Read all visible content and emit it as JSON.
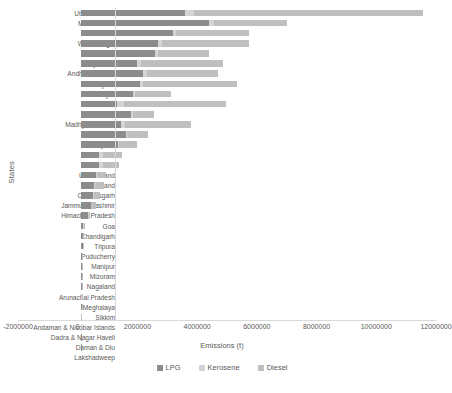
{
  "chart_data": {
    "type": "bar",
    "subtype": "horizontal-stacked",
    "title": "",
    "xlabel": "Emissions (t)",
    "ylabel": "States",
    "xlim": [
      -2000000,
      12000000
    ],
    "xticks": [
      -2000000,
      0,
      2000000,
      4000000,
      6000000,
      8000000,
      10000000,
      12000000
    ],
    "xtick_labels": [
      "-2000000",
      "0",
      "2000000",
      "4000000",
      "6000000",
      "8000000",
      "10000000",
      "12000000"
    ],
    "grid": false,
    "legend_position": "bottom",
    "legend": [
      "LPG",
      "Kerosene",
      "Diesel"
    ],
    "colors": {
      "LPG": "#8c8c8c",
      "Kerosene": "#d4d4d4",
      "Diesel": "#bfbfbf"
    },
    "categories": [
      "Uttar Pradesh",
      "Maharashtra",
      "Tamil Nadu",
      "West Bengal",
      "Karnataka",
      "Rajasthan",
      "Andhra Pradesh",
      "Gujarat",
      "Punjab",
      "Bihar",
      "Delhi",
      "Madhya Pradesh",
      "Kerala",
      "Haryana",
      "odisha",
      "Assam",
      "Uttarakhand",
      "Jharkhand",
      "Chhattisgarh",
      "Jammu & Kashmir",
      "Himachal Pradesh",
      "Goa",
      "Chandigarh",
      "Tripura",
      "Puducherry",
      "Manipur",
      "Mizoram",
      "Nagaland",
      "Arunachal Pradesh",
      "Meghalaya",
      "Sikkim",
      "Andaman & Nicobar Islands",
      "Dadra & Nagar Haveli",
      "Daman & Diu",
      "Lakshadweep"
    ],
    "series": [
      {
        "name": "LPG",
        "values": [
          3500000,
          4300000,
          3100000,
          2600000,
          2500000,
          1900000,
          2100000,
          2000000,
          1750000,
          1200000,
          1700000,
          1350000,
          1500000,
          1250000,
          620000,
          600000,
          500000,
          430000,
          400000,
          330000,
          250000,
          90000,
          80000,
          70000,
          55000,
          45000,
          30000,
          28000,
          25000,
          40000,
          18000,
          9000,
          7000,
          6000,
          2000
        ]
      },
      {
        "name": "Kerosene",
        "values": [
          280000,
          150000,
          100000,
          120000,
          90000,
          120000,
          110000,
          100000,
          60000,
          250000,
          40000,
          130000,
          60000,
          40000,
          110000,
          130000,
          30000,
          40000,
          30000,
          25000,
          15000,
          5000,
          3000,
          9000,
          4000,
          4000,
          3000,
          3000,
          3000,
          4000,
          1500,
          800,
          500,
          400,
          200
        ]
      },
      {
        "name": "Diesel",
        "values": [
          7700000,
          2450000,
          2450000,
          2900000,
          1700000,
          2750000,
          2400000,
          3150000,
          1200000,
          3400000,
          700000,
          2200000,
          700000,
          600000,
          650000,
          550000,
          330000,
          320000,
          230000,
          170000,
          60000,
          30000,
          30000,
          20000,
          18000,
          14000,
          8000,
          8000,
          9000,
          12000,
          5000,
          3000,
          2500,
          2000,
          800
        ]
      }
    ]
  },
  "axes": {
    "y_title": "States",
    "x_title": "Emissions (t)"
  }
}
